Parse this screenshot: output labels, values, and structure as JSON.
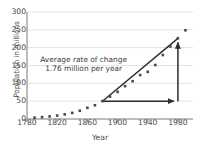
{
  "chart_data": {
    "type": "scatter",
    "title": "",
    "xlabel": "Year",
    "ylabel": "Population in millions",
    "xlim": [
      1780,
      2000
    ],
    "ylim": [
      0,
      300
    ],
    "grid": true,
    "grid_axis": "y",
    "legend": "none",
    "xticks": [
      1780,
      1820,
      1860,
      1900,
      1940,
      1980
    ],
    "xtick_labels": [
      "1780",
      "1820",
      "1860",
      "1900",
      "1940",
      "1980"
    ],
    "yticks": [
      0,
      50,
      100,
      150,
      200,
      250,
      300
    ],
    "ytick_labels": [
      "0",
      "50",
      "100",
      "150",
      "200",
      "250",
      "300"
    ],
    "series": [
      {
        "name": "US population",
        "marker": "square",
        "color": "#4a4a4a",
        "x": [
          1790,
          1800,
          1810,
          1820,
          1830,
          1840,
          1850,
          1860,
          1870,
          1880,
          1890,
          1900,
          1910,
          1920,
          1930,
          1940,
          1950,
          1960,
          1970,
          1980,
          1990
        ],
        "y": [
          3.9,
          5.3,
          7.2,
          9.6,
          12.9,
          17.1,
          23.2,
          31.4,
          38.6,
          50.2,
          62.9,
          76.2,
          92.2,
          106.0,
          123.2,
          132.2,
          151.3,
          179.3,
          203.3,
          226.5,
          248.7
        ]
      }
    ],
    "annotations": [
      {
        "name": "rate-of-change-label",
        "lines": [
          "Average rate of change",
          "1.76 million per year"
        ],
        "x": 1855,
        "y": 160
      }
    ],
    "secant": {
      "name": "secant-line",
      "x1": 1880,
      "y1": 50,
      "x2": 1980,
      "y2": 226,
      "color": "#2b2b2b"
    },
    "run_arrow": {
      "name": "run-arrow",
      "x1": 1880,
      "y1": 50,
      "x2": 1980,
      "y2": 50,
      "color": "#2b2b2b"
    },
    "rise_arrow": {
      "name": "rise-arrow",
      "x1": 1980,
      "y1": 50,
      "x2": 1980,
      "y2": 226,
      "color": "#2b2b2b"
    },
    "colors": {
      "axis": "#7a7a7a",
      "grid": "#e2e2e2",
      "marker": "#4a4a4a",
      "annotation": "#3c3c3c",
      "background": "#ffffff"
    }
  }
}
